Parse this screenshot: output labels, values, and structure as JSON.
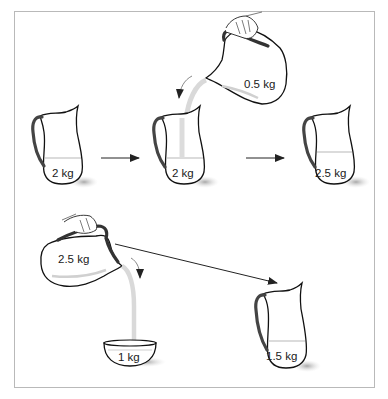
{
  "diagram": {
    "type": "mass-conservation-illustration",
    "colors": {
      "outline": "#111111",
      "handle": "#444444",
      "liquid_line": "#cfcfcf",
      "pour_stream": "#d9d9d9",
      "shadow": "#bdbdbd",
      "frame": "#b9b9b9",
      "arrow": "#222222"
    },
    "top_row": {
      "pitcher_start": {
        "label": "2 kg"
      },
      "pouring_pitcher": {
        "label": "0.5 kg"
      },
      "pitcher_receiving": {
        "label": "2 kg"
      },
      "pitcher_result": {
        "label": "2.5 kg"
      }
    },
    "bottom_row": {
      "pouring_pitcher": {
        "label": "2.5 kg"
      },
      "bowl": {
        "label": "1 kg"
      },
      "pitcher_result": {
        "label": "1.5 kg"
      }
    }
  }
}
